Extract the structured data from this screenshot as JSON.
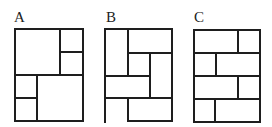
{
  "figures": [
    {
      "label": "A",
      "label_pos": [
        14,
        22
      ],
      "lines": [
        [
          15,
          29,
          83,
          29
        ],
        [
          15,
          29,
          15,
          121
        ],
        [
          83,
          29,
          83,
          121
        ],
        [
          15,
          121,
          83,
          121
        ],
        [
          60,
          29,
          60,
          75
        ],
        [
          60,
          52,
          83,
          52
        ],
        [
          15,
          75,
          83,
          75
        ],
        [
          37,
          75,
          37,
          121
        ],
        [
          15,
          98,
          37,
          98
        ]
      ]
    },
    {
      "label": "B",
      "label_pos": [
        106,
        22
      ],
      "lines": [
        [
          105,
          29,
          172,
          29
        ],
        [
          105,
          29,
          105,
          122
        ],
        [
          172,
          29,
          172,
          121
        ],
        [
          128,
          29,
          128,
          76
        ],
        [
          128,
          53,
          172,
          53
        ],
        [
          150,
          53,
          150,
          98
        ],
        [
          105,
          76,
          150,
          76
        ],
        [
          105,
          98,
          172,
          98
        ],
        [
          128,
          98,
          128,
          121
        ],
        [
          128,
          121,
          172,
          121
        ]
      ]
    },
    {
      "label": "C",
      "label_pos": [
        194,
        22
      ],
      "lines": [
        [
          194,
          30,
          260,
          30
        ],
        [
          194,
          30,
          194,
          122
        ],
        [
          260,
          30,
          260,
          122
        ],
        [
          194,
          122,
          260,
          122
        ],
        [
          194,
          53,
          260,
          53
        ],
        [
          194,
          76,
          260,
          76
        ],
        [
          194,
          99,
          260,
          99
        ],
        [
          238,
          30,
          238,
          53
        ],
        [
          216,
          53,
          216,
          76
        ],
        [
          238,
          76,
          238,
          99
        ],
        [
          215,
          99,
          215,
          122
        ]
      ]
    }
  ],
  "colors": {
    "line": "#1e1e1e",
    "label": "#222222",
    "background": "#ffffff"
  }
}
